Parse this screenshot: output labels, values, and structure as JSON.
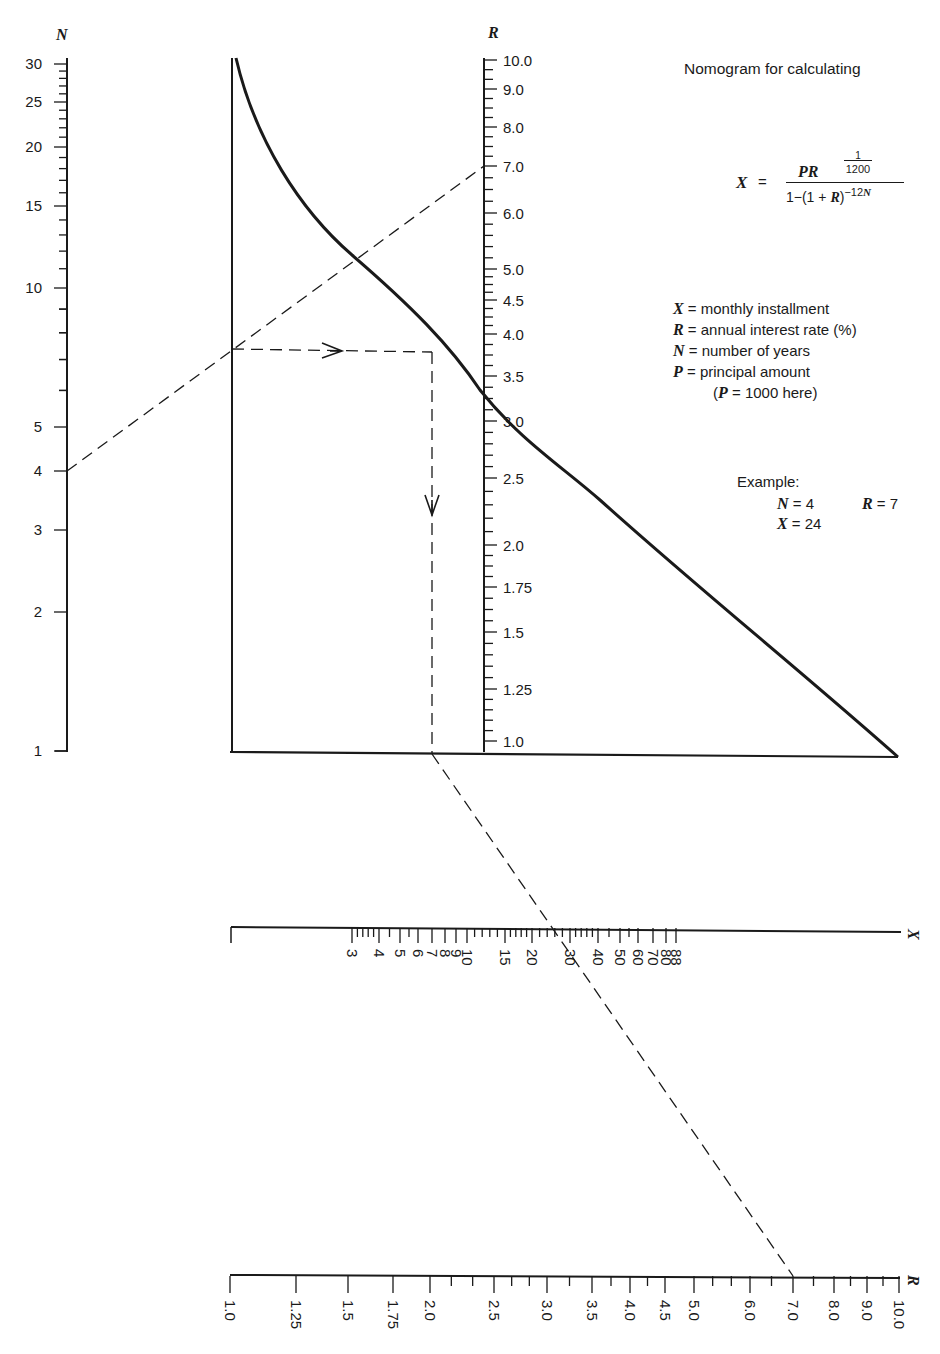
{
  "title": "Nomogram for calculating",
  "formula": {
    "lhs": "X",
    "equals": "=",
    "numerator": "PR",
    "numerator_fraction_top": "1",
    "numerator_fraction_bottom": "1200",
    "denominator_prefix": "1−(1 + ",
    "denominator_var": "R",
    "denominator_suffix": ")",
    "denominator_exponent": "−12",
    "denominator_exponent_var": "N"
  },
  "legend": [
    {
      "var": "X",
      "text": "= monthly installment"
    },
    {
      "var": "R",
      "text": "= annual interest rate (%)"
    },
    {
      "var": "N",
      "text": "= number of years"
    },
    {
      "var": "P",
      "text": "= principal amount"
    }
  ],
  "legend_note": {
    "prefix": "(",
    "var": "P",
    "text": " = 1000 here)"
  },
  "example": {
    "label": "Example:",
    "n": {
      "var": "N",
      "text": "= 4"
    },
    "r": {
      "var": "R",
      "text": "= 7"
    },
    "x": {
      "var": "X",
      "text": "= 24"
    }
  },
  "axes": {
    "n_axis": {
      "label": "N",
      "ticks": [
        {
          "label": "30",
          "y": 64
        },
        {
          "label": "25",
          "y": 102
        },
        {
          "label": "20",
          "y": 147
        },
        {
          "label": "15",
          "y": 206
        },
        {
          "label": "10",
          "y": 288
        },
        {
          "label": "5",
          "y": 427
        },
        {
          "label": "4",
          "y": 471
        },
        {
          "label": "3",
          "y": 530
        },
        {
          "label": "2",
          "y": 612
        },
        {
          "label": "1",
          "y": 751
        }
      ]
    },
    "r_axis_vertical": {
      "label": "R",
      "ticks": [
        {
          "label": "10.0",
          "y": 60
        },
        {
          "label": "9.0",
          "y": 89
        },
        {
          "label": "8.0",
          "y": 127
        },
        {
          "label": "7.0",
          "y": 166
        },
        {
          "label": "6.0",
          "y": 213
        },
        {
          "label": "5.0",
          "y": 269
        },
        {
          "label": "4.5",
          "y": 300
        },
        {
          "label": "4.0",
          "y": 334
        },
        {
          "label": "3.5",
          "y": 376
        },
        {
          "label": "3.0",
          "y": 421
        },
        {
          "label": "2.5",
          "y": 478
        },
        {
          "label": "2.0",
          "y": 545
        },
        {
          "label": "1.75",
          "y": 587
        },
        {
          "label": "1.5",
          "y": 632
        },
        {
          "label": "1.25",
          "y": 689
        },
        {
          "label": "1.0",
          "y": 741
        }
      ]
    },
    "x_axis": {
      "label": "X",
      "ticks": [
        {
          "label": "3",
          "x": 352
        },
        {
          "label": "4",
          "x": 379
        },
        {
          "label": "5",
          "x": 400
        },
        {
          "label": "6",
          "x": 418
        },
        {
          "label": "7",
          "x": 432
        },
        {
          "label": "8",
          "x": 445
        },
        {
          "label": "9",
          "x": 456
        },
        {
          "label": "10",
          "x": 467
        },
        {
          "label": "15",
          "x": 505
        },
        {
          "label": "20",
          "x": 532
        },
        {
          "label": "30",
          "x": 570
        },
        {
          "label": "40",
          "x": 598
        },
        {
          "label": "50",
          "x": 620
        },
        {
          "label": "60",
          "x": 638
        },
        {
          "label": "70",
          "x": 653
        },
        {
          "label": "80",
          "x": 666
        },
        {
          "label": "88",
          "x": 676
        }
      ]
    },
    "r_axis_horizontal": {
      "label": "R",
      "ticks": [
        {
          "label": "1.0",
          "x": 230
        },
        {
          "label": "1.25",
          "x": 296
        },
        {
          "label": "1.5",
          "x": 348
        },
        {
          "label": "1.75",
          "x": 393
        },
        {
          "label": "2.0",
          "x": 430
        },
        {
          "label": "2.5",
          "x": 494
        },
        {
          "label": "3.0",
          "x": 547
        },
        {
          "label": "3.5",
          "x": 592
        },
        {
          "label": "4.0",
          "x": 630
        },
        {
          "label": "4.5",
          "x": 665
        },
        {
          "label": "5.0",
          "x": 694
        },
        {
          "label": "6.0",
          "x": 750
        },
        {
          "label": "7.0",
          "x": 793
        },
        {
          "label": "8.0",
          "x": 834
        },
        {
          "label": "9.0",
          "x": 867
        },
        {
          "label": "10.0",
          "x": 899
        }
      ]
    }
  },
  "colors": {
    "ink": "#1a1a1a",
    "background": "#ffffff"
  }
}
